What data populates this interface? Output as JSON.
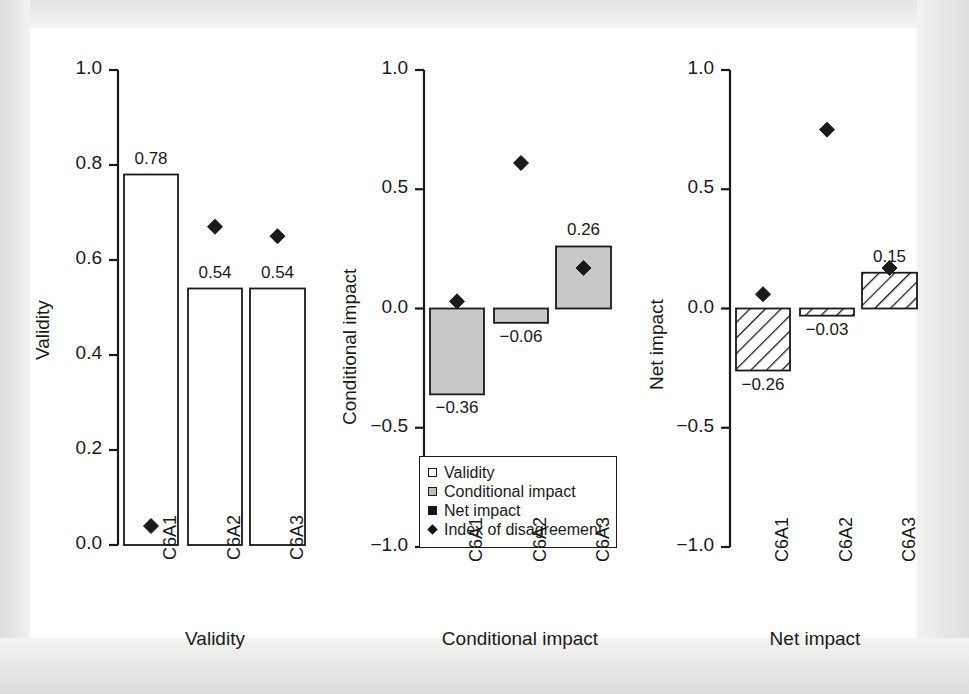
{
  "figure": {
    "background": "#e9e9e7",
    "page_background": "#ffffff",
    "ink": "#1a1a1a"
  },
  "legend": {
    "items": [
      {
        "label": "Validity",
        "marker": "open-square",
        "color": "#ffffff"
      },
      {
        "label": "Conditional impact",
        "marker": "gray-square",
        "color": "#bdbdbd"
      },
      {
        "label": "Net impact",
        "marker": "solid-square",
        "color": "#141414"
      },
      {
        "label": "Index of disagreement",
        "marker": "solid-diamond",
        "color": "#141414"
      }
    ]
  },
  "chart_data": [
    {
      "type": "bar",
      "panel": "validity",
      "title": "",
      "xlabel": "Validity",
      "ylabel": "Validity",
      "categories": [
        "C6A1",
        "C6A2",
        "C6A3"
      ],
      "values": [
        0.78,
        0.54,
        0.54
      ],
      "value_labels": [
        "0.78",
        "0.54",
        "0.54"
      ],
      "bar_style": "open",
      "bar_fill": "#ffffff",
      "ylim": [
        0.0,
        1.0
      ],
      "yticks": [
        0.0,
        0.2,
        0.4,
        0.6,
        0.8,
        1.0
      ],
      "ytick_labels": [
        "0.0",
        "0.2",
        "0.4",
        "0.6",
        "0.8",
        "1.0"
      ],
      "grid": false,
      "series": [
        {
          "name": "Index of disagreement",
          "type": "scatter",
          "marker": "solid-diamond",
          "values": [
            0.04,
            0.67,
            0.65
          ]
        }
      ]
    },
    {
      "type": "bar",
      "panel": "conditional-impact",
      "title": "",
      "xlabel": "Conditional impact",
      "ylabel": "Conditional impact",
      "categories": [
        "C6A1",
        "C6A2",
        "C6A3"
      ],
      "values": [
        -0.36,
        -0.06,
        0.26
      ],
      "value_labels": [
        "−0.36",
        "−0.06",
        "0.26"
      ],
      "bar_style": "gray",
      "bar_fill": "#c9c9c9",
      "ylim": [
        -1.0,
        1.0
      ],
      "yticks": [
        -1.0,
        -0.5,
        0.0,
        0.5,
        1.0
      ],
      "ytick_labels": [
        "−1.0",
        "−0.5",
        "0.0",
        "0.5",
        "1.0"
      ],
      "grid": false,
      "series": [
        {
          "name": "Index of disagreement",
          "type": "scatter",
          "marker": "solid-diamond",
          "values": [
            0.03,
            0.61,
            0.17
          ]
        }
      ]
    },
    {
      "type": "bar",
      "panel": "net-impact",
      "title": "",
      "xlabel": "Net impact",
      "ylabel": "Net impact",
      "categories": [
        "C6A1",
        "C6A2",
        "C6A3"
      ],
      "values": [
        -0.26,
        -0.03,
        0.15
      ],
      "value_labels": [
        "−0.26",
        "−0.03",
        "0.15"
      ],
      "bar_style": "hatched",
      "bar_fill": "#ffffff",
      "ylim": [
        -1.0,
        1.0
      ],
      "yticks": [
        -1.0,
        -0.5,
        0.0,
        0.5,
        1.0
      ],
      "ytick_labels": [
        "−1.0",
        "−0.5",
        "0.0",
        "0.5",
        "1.0"
      ],
      "grid": false,
      "series": [
        {
          "name": "Index of disagreement",
          "type": "scatter",
          "marker": "solid-diamond",
          "values": [
            0.06,
            0.75,
            0.17
          ]
        }
      ]
    }
  ]
}
